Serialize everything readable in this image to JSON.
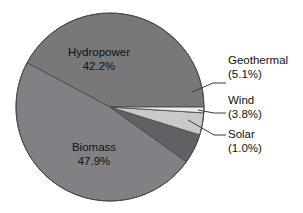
{
  "chart_data": {
    "type": "pie",
    "title": "",
    "subtitle": "",
    "xlabel": "",
    "ylabel": "",
    "legend_position": "none",
    "grid": false,
    "units": "percent",
    "categories": [
      "Hydropower",
      "Biomass",
      "Geothermal",
      "Wind",
      "Solar"
    ],
    "values": [
      42.2,
      47.9,
      5.1,
      3.8,
      1.0
    ],
    "slices": [
      {
        "name": "Hydropower",
        "value": 42.2,
        "label_text": "Hydropower",
        "value_text": "42.2%",
        "color": "#787879",
        "label_style": "inside",
        "start_angle_deg": 0.0,
        "end_angle_deg": 151.92
      },
      {
        "name": "Biomass",
        "value": 47.9,
        "label_text": "Biomass",
        "value_text": "47.9%",
        "color": "#818185",
        "label_style": "inside",
        "start_angle_deg": 151.92,
        "end_angle_deg": 324.36
      },
      {
        "name": "Geothermal",
        "value": 5.1,
        "label_text": "Geothermal",
        "value_text": "(5.1%)",
        "color": "#616165",
        "label_style": "callout",
        "start_angle_deg": 324.36,
        "end_angle_deg": 342.72
      },
      {
        "name": "Wind",
        "value": 3.8,
        "label_text": "Wind",
        "value_text": "(3.8%)",
        "color": "#c9c9c9",
        "label_style": "callout",
        "start_angle_deg": 342.72,
        "end_angle_deg": 356.4
      },
      {
        "name": "Solar",
        "value": 1.0,
        "label_text": "Solar",
        "value_text": "(1.0%)",
        "color": "#ebebeb",
        "label_style": "callout",
        "start_angle_deg": 356.4,
        "end_angle_deg": 360.0
      }
    ],
    "colors": {
      "hydropower": "#787879",
      "biomass": "#818185",
      "geothermal": "#616165",
      "wind": "#c9c9c9",
      "solar": "#ebebeb",
      "outline": "#4a4a4a",
      "leader_line": "#3a3a3a",
      "background": "#ffffff",
      "text": "#111111"
    },
    "geometry": {
      "center_x": 110,
      "center_y": 107,
      "radius": 94
    }
  },
  "labels": {
    "hydropower": {
      "name": "Hydropower",
      "value": "42.2%"
    },
    "biomass": {
      "name": "Biomass",
      "value": "47.9%"
    },
    "geothermal": {
      "name": "Geothermal",
      "value": "(5.1%)"
    },
    "wind": {
      "name": "Wind",
      "value": "(3.8%)"
    },
    "solar": {
      "name": "Solar",
      "value": "(1.0%)"
    }
  }
}
